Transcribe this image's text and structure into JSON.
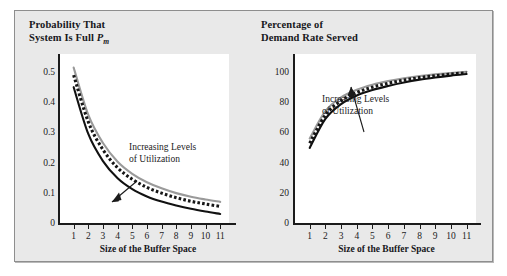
{
  "figure": {
    "panel_bg": "#e9e9e9",
    "panel_border": "#8e8e8e",
    "plot_bg": "#ffffff",
    "axis_color": "#1b1b1b"
  },
  "chart_data": [
    {
      "id": "left",
      "type": "line",
      "title": "Probability That System Is Full P",
      "title_line1": "Probability That",
      "title_line2": "System Is Full ",
      "title_symbol": "P",
      "title_subscript": "m",
      "xlabel": "Size of the Buffer Space",
      "ylabel": "",
      "xlim": [
        0,
        11.6
      ],
      "ylim": [
        0,
        0.56
      ],
      "grid": false,
      "legend": "none",
      "xticks": [
        1,
        2,
        3,
        4,
        5,
        6,
        7,
        8,
        9,
        10,
        11
      ],
      "xtick_labels": [
        "1",
        "2",
        "3",
        "4",
        "5",
        "6",
        "7",
        "8",
        "9",
        "10",
        "11"
      ],
      "yticks": [
        0,
        0.1,
        0.2,
        0.3,
        0.4,
        0.5
      ],
      "ytick_labels": [
        "0",
        "0.1",
        "0.2",
        "0.3",
        "0.4",
        "0.5"
      ],
      "annotation": "Increasing Levels of Utilization",
      "annotation_line1": "Increasing Levels",
      "annotation_line2": "of Utilization",
      "x": [
        1,
        2,
        3,
        4,
        5,
        6,
        7,
        8,
        9,
        10,
        11
      ],
      "series": [
        {
          "name": "lower utilization",
          "style": "solid",
          "color": "#111111",
          "values": [
            0.45,
            0.295,
            0.205,
            0.148,
            0.112,
            0.088,
            0.071,
            0.058,
            0.047,
            0.038,
            0.03
          ]
        },
        {
          "name": "medium utilization",
          "style": "dotted",
          "color": "#161616",
          "values": [
            0.49,
            0.335,
            0.243,
            0.183,
            0.145,
            0.118,
            0.099,
            0.084,
            0.072,
            0.063,
            0.055
          ]
        },
        {
          "name": "higher utilization",
          "style": "solid",
          "color": "#9a9a9a",
          "values": [
            0.515,
            0.358,
            0.265,
            0.203,
            0.163,
            0.135,
            0.115,
            0.099,
            0.087,
            0.078,
            0.07
          ]
        }
      ]
    },
    {
      "id": "right",
      "type": "line",
      "title": "Percentage of Demand Rate Served",
      "title_line1": "Percentage of",
      "title_line2": "Demand Rate Served",
      "xlabel": "Size of the Buffer Space",
      "ylabel": "",
      "xlim": [
        0,
        11.6
      ],
      "ylim": [
        0,
        108
      ],
      "grid": false,
      "legend": "none",
      "xticks": [
        1,
        2,
        3,
        4,
        5,
        6,
        7,
        8,
        9,
        10,
        11
      ],
      "xtick_labels": [
        "1",
        "2",
        "3",
        "4",
        "5",
        "6",
        "7",
        "8",
        "9",
        "10",
        "11"
      ],
      "yticks": [
        0,
        20,
        40,
        60,
        80,
        100
      ],
      "ytick_labels": [
        "0",
        "20",
        "40",
        "60",
        "80",
        "100"
      ],
      "annotation": "Increasing Levels of Utilization",
      "annotation_line1": "Increasing Levels",
      "annotation_line2": "of Utilization",
      "x": [
        1,
        2,
        3,
        4,
        5,
        6,
        7,
        8,
        9,
        10,
        11
      ],
      "series": [
        {
          "name": "lower utilization",
          "style": "solid",
          "color": "#111111",
          "values": [
            48.0,
            66.5,
            76.0,
            81.5,
            85.0,
            87.6,
            89.8,
            91.6,
            93.0,
            94.2,
            95.2
          ]
        },
        {
          "name": "medium utilization",
          "style": "dotted",
          "color": "#161616",
          "values": [
            51.0,
            69.0,
            78.2,
            83.4,
            86.8,
            89.3,
            91.3,
            92.9,
            94.1,
            95.2,
            96.0
          ]
        },
        {
          "name": "higher utilization",
          "style": "solid",
          "color": "#9a9a9a",
          "values": [
            54.0,
            71.5,
            80.3,
            85.2,
            88.4,
            90.7,
            92.5,
            93.9,
            95.0,
            95.9,
            96.7
          ]
        }
      ]
    }
  ]
}
